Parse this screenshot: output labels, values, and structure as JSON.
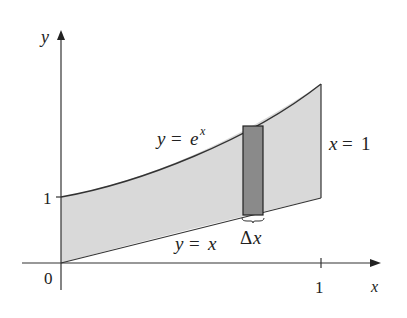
{
  "diagram": {
    "axes": {
      "x_label": "x",
      "y_label": "y",
      "origin_label": "0",
      "x_tick_label": "1",
      "y_tick_label": "1"
    },
    "curves": {
      "upper": {
        "label_var": "y",
        "label_eq": "=",
        "label_base": "e",
        "label_exp": "x"
      },
      "lower": {
        "label_var": "y",
        "label_eq": "=",
        "label_rhs": "x"
      },
      "right_boundary": {
        "label_var": "x",
        "label_eq": "=",
        "label_rhs": "1"
      }
    },
    "strip": {
      "label_delta": "Δ",
      "label_var": "x"
    },
    "colors": {
      "region_fill": "#d9d9d9",
      "strip_fill": "#8a8a8a",
      "stroke": "#333333"
    }
  }
}
